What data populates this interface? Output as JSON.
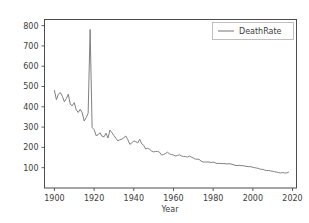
{
  "figure": {
    "width": 309,
    "height": 223,
    "background": "#ffffff",
    "faint_top_text": ""
  },
  "axes": {
    "frame_color": "#4d4d4d",
    "tick_color": "#4d4d4d",
    "label_color": "#3c3c3c"
  },
  "legend": {
    "entries": [
      {
        "label": "DeathRate",
        "color": "#808080"
      }
    ],
    "position": "upper right",
    "border_color": "#b0b0b0"
  },
  "chart_data": {
    "type": "line",
    "title": "",
    "xlabel": "Year",
    "ylabel": "",
    "xlim": [
      1895,
      2022
    ],
    "ylim": [
      0,
      830
    ],
    "xticks": [
      1900,
      1920,
      1940,
      1960,
      1980,
      2000,
      2020
    ],
    "yticks": [
      100,
      200,
      300,
      400,
      500,
      600,
      700,
      800
    ],
    "xtick_labels": [
      "1900",
      "1920",
      "1940",
      "1960",
      "1980",
      "2000",
      "2020"
    ],
    "ytick_labels": [
      "100",
      "200",
      "300",
      "400",
      "500",
      "600",
      "700",
      "800"
    ],
    "grid": false,
    "legend_position": "upper right",
    "series": [
      {
        "name": "DeathRate",
        "color": "#808080",
        "linewidth": 1,
        "x": [
          1900,
          1901,
          1902,
          1903,
          1904,
          1905,
          1906,
          1907,
          1908,
          1909,
          1910,
          1911,
          1912,
          1913,
          1914,
          1915,
          1916,
          1917,
          1918,
          1919,
          1920,
          1921,
          1922,
          1923,
          1924,
          1925,
          1926,
          1927,
          1928,
          1929,
          1930,
          1931,
          1932,
          1933,
          1934,
          1935,
          1936,
          1937,
          1938,
          1939,
          1940,
          1941,
          1942,
          1943,
          1944,
          1945,
          1946,
          1947,
          1948,
          1949,
          1950,
          1951,
          1952,
          1953,
          1954,
          1955,
          1956,
          1957,
          1958,
          1959,
          1960,
          1961,
          1962,
          1963,
          1964,
          1965,
          1966,
          1967,
          1968,
          1969,
          1970,
          1971,
          1972,
          1973,
          1974,
          1975,
          1976,
          1977,
          1978,
          1979,
          1980,
          1981,
          1982,
          1983,
          1984,
          1985,
          1986,
          1987,
          1988,
          1989,
          1990,
          1991,
          1992,
          1993,
          1994,
          1995,
          1996,
          1997,
          1998,
          1999,
          2000,
          2001,
          2002,
          2003,
          2004,
          2005,
          2006,
          2007,
          2008,
          2009,
          2010,
          2011,
          2012,
          2013,
          2014,
          2015,
          2016,
          2017,
          2018
        ],
        "y": [
          480,
          435,
          462,
          470,
          452,
          425,
          440,
          462,
          412,
          405,
          420,
          385,
          372,
          388,
          370,
          330,
          347,
          368,
          781,
          298,
          288,
          258,
          262,
          272,
          255,
          252,
          270,
          246,
          285,
          272,
          258,
          245,
          232,
          238,
          240,
          248,
          256,
          238,
          215,
          222,
          232,
          228,
          222,
          240,
          218,
          210,
          192,
          196,
          190,
          182,
          178,
          180,
          180,
          176,
          162,
          165,
          170,
          176,
          168,
          165,
          162,
          158,
          160,
          164,
          158,
          155,
          155,
          152,
          158,
          152,
          148,
          142,
          142,
          140,
          132,
          128,
          128,
          128,
          128,
          125,
          128,
          124,
          120,
          122,
          120,
          120,
          120,
          118,
          120,
          118,
          115,
          112,
          110,
          112,
          110,
          110,
          108,
          106,
          105,
          105,
          102,
          100,
          98,
          96,
          92,
          92,
          88,
          86,
          86,
          84,
          82,
          80,
          78,
          76,
          74,
          76,
          74,
          74,
          78
        ]
      }
    ]
  }
}
